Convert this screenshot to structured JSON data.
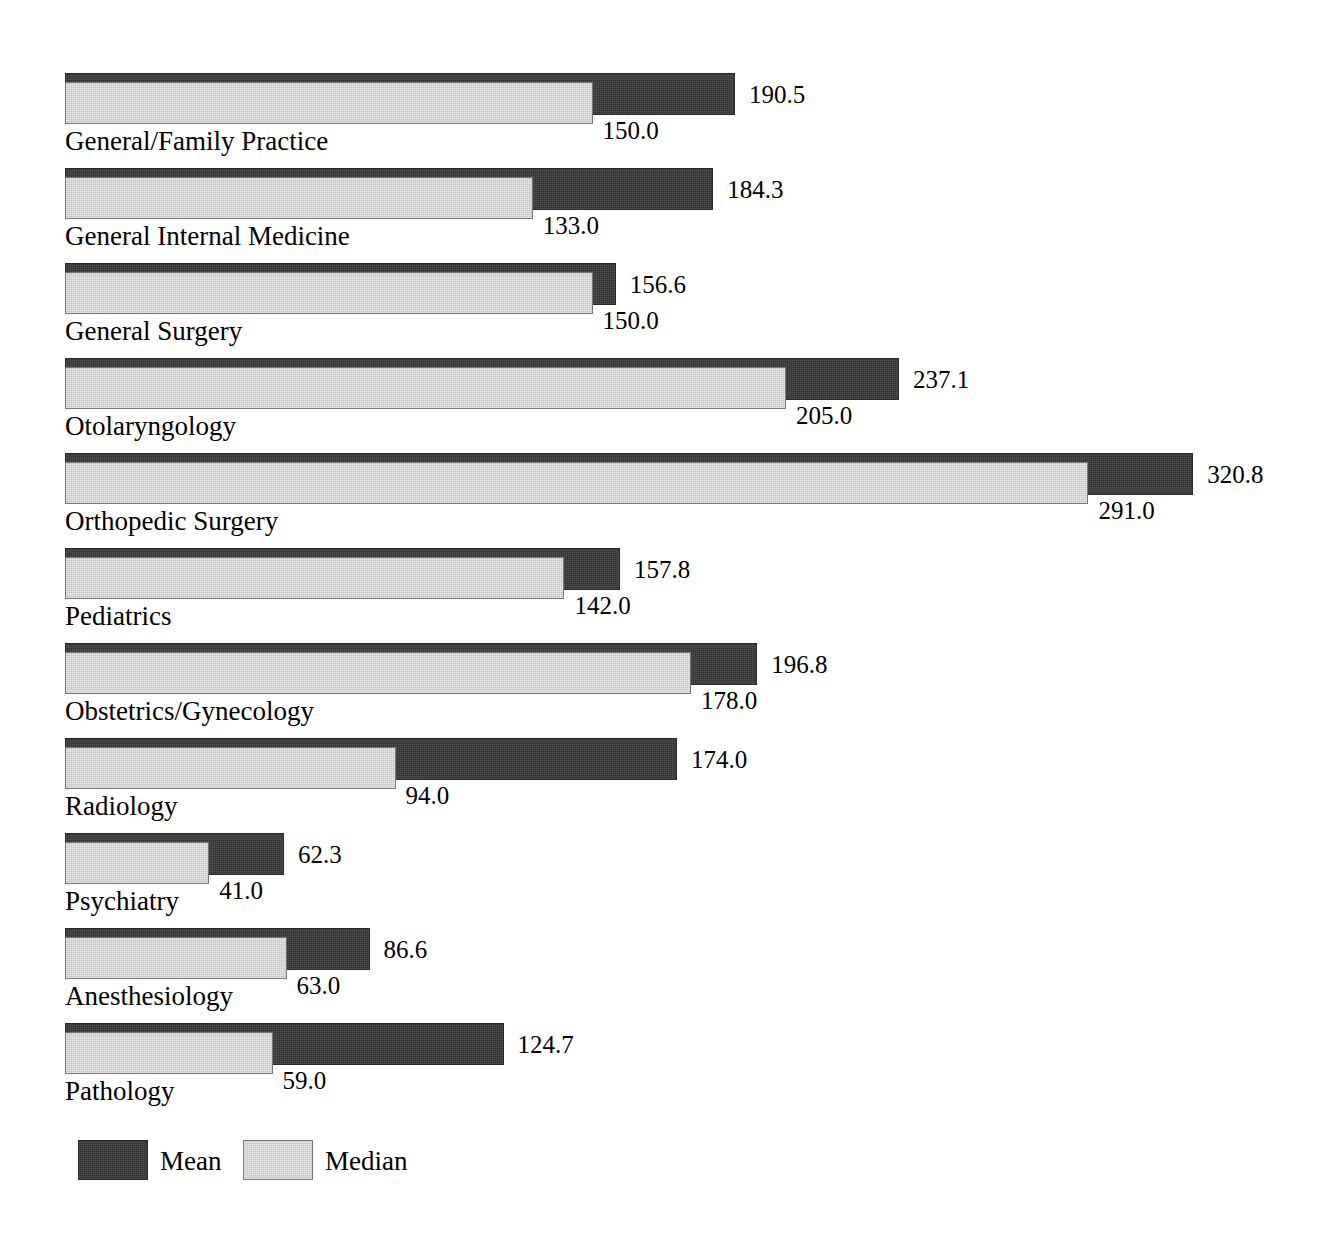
{
  "chart_data": {
    "type": "bar",
    "orientation": "horizontal",
    "title": "",
    "subtitle": "",
    "xlabel": "",
    "ylabel": "",
    "grid": false,
    "axis_visible": false,
    "xlim": [
      0,
      320.8
    ],
    "legend_position": "bottom-left",
    "categories": [
      "General/Family Practice",
      "General Internal Medicine",
      "General Surgery",
      "Otolaryngology",
      "Orthopedic Surgery",
      "Pediatrics",
      "Obstetrics/Gynecology",
      "Radiology",
      "Psychiatry",
      "Anesthesiology",
      "Pathology"
    ],
    "series": [
      {
        "name": "Mean",
        "color": "#333333",
        "values": [
          190.5,
          184.3,
          156.6,
          237.1,
          320.8,
          157.8,
          196.8,
          174.0,
          62.3,
          86.6,
          124.7
        ],
        "labels": [
          "190.5",
          "184.3",
          "156.6",
          "237.1",
          "320.8",
          "157.8",
          "196.8",
          "174.0",
          "62.3",
          "86.6",
          "124.7"
        ]
      },
      {
        "name": "Median",
        "color": "#c4c4c4",
        "values": [
          150.0,
          133.0,
          150.0,
          205.0,
          291.0,
          142.0,
          178.0,
          94.0,
          41.0,
          63.0,
          59.0
        ],
        "labels": [
          "150.0",
          "133.0",
          "150.0",
          "205.0",
          "291.0",
          "142.0",
          "178.0",
          "94.0",
          "41.0",
          "63.0",
          "59.0"
        ]
      }
    ]
  },
  "legend": {
    "items": [
      {
        "label": "Mean",
        "swatch": "mean"
      },
      {
        "label": "Median",
        "swatch": "median"
      }
    ]
  }
}
